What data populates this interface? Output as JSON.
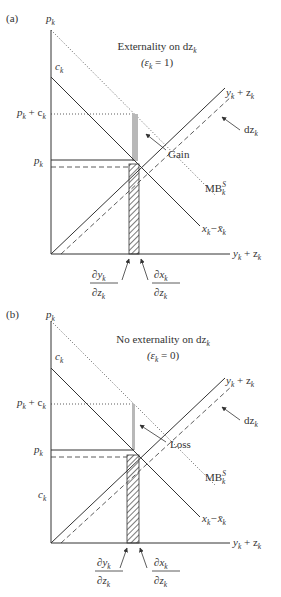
{
  "figure": {
    "panels": [
      {
        "id": "a",
        "label": "(a)",
        "title_line1": "Externality on dz",
        "title_line1_sub": "k",
        "title_line2_prefix": "(ε",
        "title_line2_sub": "k",
        "title_line2_suffix": " = 1)",
        "region_label": "Gain",
        "axis": {
          "y_label": "p",
          "y_label_sub": "k",
          "x_label": "y",
          "x_label_sub": "k",
          "x_label_plus": " + z",
          "x_label_sub2": "k"
        },
        "y_ticks": [
          {
            "text": "c",
            "sub": "k"
          },
          {
            "text": "p",
            "sub": "k",
            "plus": " + c",
            "sub2": "k"
          },
          {
            "text": "p",
            "sub": "k"
          }
        ],
        "curves": {
          "supply": {
            "text": "y",
            "sub": "k",
            "plus": " + z",
            "sub2": "k"
          },
          "shift": {
            "text": "dz",
            "sub": "k"
          },
          "mb_social": {
            "text": "MB",
            "sup": "S",
            "sub": "k"
          },
          "demand": {
            "text": "x",
            "sub": "k",
            "minus": "−x̄",
            "sub2": "k"
          }
        },
        "x_annotations": [
          {
            "num": "∂y",
            "num_sub": "k",
            "den": "∂z",
            "den_sub": "k"
          },
          {
            "num": "∂x",
            "num_sub": "k",
            "den": "∂z",
            "den_sub": "k"
          }
        ]
      },
      {
        "id": "b",
        "label": "(b)",
        "title_line1": "No externality on dz",
        "title_line1_sub": "k",
        "title_line2_prefix": "(ε",
        "title_line2_sub": "k",
        "title_line2_suffix": " = 0)",
        "region_label": "Loss",
        "axis": {
          "y_label": "p",
          "y_label_sub": "k",
          "x_label": "y",
          "x_label_sub": "k",
          "x_label_plus": " + z",
          "x_label_sub2": "k"
        },
        "y_ticks": [
          {
            "text": "c",
            "sub": "k"
          },
          {
            "text": "p",
            "sub": "k",
            "plus": " + c",
            "sub2": "k"
          },
          {
            "text": "p",
            "sub": "k"
          },
          {
            "text": "c",
            "sub": "k"
          }
        ],
        "curves": {
          "supply": {
            "text": "y",
            "sub": "k",
            "plus": " + z",
            "sub2": "k"
          },
          "shift": {
            "text": "dz",
            "sub": "k"
          },
          "mb_social": {
            "text": "MB",
            "sup": "S",
            "sub": "k"
          },
          "demand": {
            "text": "x",
            "sub": "k",
            "minus": "−x̄",
            "sub2": "k"
          }
        },
        "x_annotations": [
          {
            "num": "∂y",
            "num_sub": "k",
            "den": "∂z",
            "den_sub": "k"
          },
          {
            "num": "∂x",
            "num_sub": "k",
            "den": "∂z",
            "den_sub": "k"
          }
        ]
      }
    ],
    "colors": {
      "line": "#333333",
      "gray_bar": "#b8b8b8",
      "hatch": "#333333"
    }
  }
}
